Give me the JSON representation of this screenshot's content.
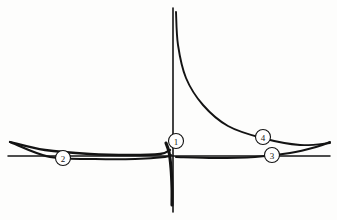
{
  "figure": {
    "name": "hand-drawn-curve-diagram",
    "background_color": "#fdfdfc",
    "ink_color": "#131313",
    "width": 337,
    "height": 220
  },
  "chart_data": {
    "type": "line",
    "title": "",
    "subtitle": "",
    "xlabel": "",
    "ylabel": "",
    "grid": false,
    "legend": "none",
    "axes": {
      "vertical_asymptote_x": 173,
      "horizontal_asymptote_y": 155,
      "vertical_line_top_y": 8,
      "vertical_line_bottom_y": 212
    },
    "xlim": [
      0,
      337
    ],
    "ylim": [
      220,
      0
    ],
    "series": [
      {
        "name": "vertical-asymptote",
        "style": "thin-straight",
        "points": [
          [
            173,
            8
          ],
          [
            173,
            212
          ]
        ]
      },
      {
        "name": "horizontal-asymptote",
        "style": "thin-straight",
        "points": [
          [
            8,
            156
          ],
          [
            330,
            156
          ]
        ]
      },
      {
        "name": "hyperbola-right-branch",
        "style": "curve",
        "points": [
          [
            176,
            12
          ],
          [
            178,
            45
          ],
          [
            186,
            78
          ],
          [
            203,
            105
          ],
          [
            228,
            126
          ],
          [
            262,
            138
          ],
          [
            300,
            145
          ],
          [
            330,
            143
          ]
        ]
      },
      {
        "name": "hyperbola-left-branch-descending-spike",
        "style": "thick-curve",
        "points": [
          [
            166,
            143
          ],
          [
            169,
            152
          ],
          [
            171,
            168
          ],
          [
            172,
            188
          ],
          [
            172,
            205
          ]
        ]
      },
      {
        "name": "upper-left-lens-curve",
        "style": "thick-curve",
        "points": [
          [
            10,
            142
          ],
          [
            45,
            150
          ],
          [
            90,
            154
          ],
          [
            130,
            155
          ],
          [
            160,
            154
          ],
          [
            170,
            150
          ]
        ]
      },
      {
        "name": "lower-left-lens-curve",
        "style": "thick-curve",
        "points": [
          [
            10,
            142
          ],
          [
            50,
            157
          ],
          [
            95,
            159
          ],
          [
            135,
            159
          ],
          [
            165,
            157
          ],
          [
            171,
            155
          ]
        ]
      },
      {
        "name": "right-lens-curve",
        "style": "thick-curve",
        "points": [
          [
            176,
            157
          ],
          [
            215,
            158
          ],
          [
            255,
            157
          ],
          [
            290,
            153
          ],
          [
            316,
            147
          ],
          [
            330,
            142
          ]
        ]
      }
    ],
    "annotations": [
      {
        "id": "callout-1",
        "label": "1",
        "cx": 176,
        "cy": 141,
        "r": 7.5,
        "description": "origin intersection of asymptotes and curve branches"
      },
      {
        "id": "callout-2",
        "label": "2",
        "cx": 63,
        "cy": 158,
        "r": 7.5,
        "description": "left lens-shaped curve pair"
      },
      {
        "id": "callout-3",
        "label": "3",
        "cx": 272,
        "cy": 155,
        "r": 7.5,
        "description": "right horizontal asymptote line"
      },
      {
        "id": "callout-4",
        "label": "4",
        "cx": 263,
        "cy": 137,
        "r": 7.5,
        "description": "right descending hyperbola branch"
      }
    ]
  }
}
